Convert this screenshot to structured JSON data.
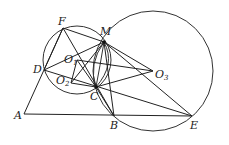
{
  "diagram": {
    "type": "geometry-figure",
    "stroke_color": "#222222",
    "background": "#ffffff",
    "points": {
      "A": {
        "label": "A",
        "sub": "",
        "x": 24,
        "y": 114,
        "lx": 14,
        "ly": 119
      },
      "B": {
        "label": "B",
        "sub": "",
        "x": 114,
        "y": 116,
        "lx": 110,
        "ly": 129
      },
      "C": {
        "label": "C",
        "sub": "",
        "x": 96,
        "y": 87,
        "lx": 90,
        "ly": 100
      },
      "D": {
        "label": "D",
        "sub": "",
        "x": 44,
        "y": 70,
        "lx": 33,
        "ly": 73
      },
      "E": {
        "label": "E",
        "sub": "",
        "x": 192,
        "y": 116,
        "lx": 190,
        "ly": 129
      },
      "F": {
        "label": "F",
        "sub": "",
        "x": 63,
        "y": 28,
        "lx": 58,
        "ly": 25
      },
      "M": {
        "label": "M",
        "sub": "",
        "x": 104,
        "y": 42,
        "lx": 100,
        "ly": 35
      },
      "O1": {
        "label": "O",
        "sub": "1",
        "x": 77,
        "y": 60,
        "lx": 64,
        "ly": 63
      },
      "O2": {
        "label": "O",
        "sub": "2",
        "x": 71,
        "y": 83,
        "lx": 56,
        "ly": 84
      },
      "O3": {
        "label": "O",
        "sub": "3",
        "x": 153,
        "y": 71,
        "lx": 155,
        "ly": 78
      }
    },
    "circles": [
      {
        "name": "circle-O1",
        "cx": 77,
        "cy": 60,
        "r": 34
      },
      {
        "name": "circle-O3",
        "cx": 153,
        "cy": 71,
        "r": 60
      }
    ]
  }
}
